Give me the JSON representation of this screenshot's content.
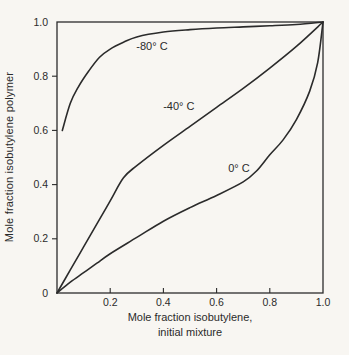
{
  "figure": {
    "background": "#f8f6f2",
    "ink": "#2b2b2b"
  },
  "chart_data": {
    "type": "line",
    "title": "",
    "xlabel": "Mole fraction isobutylene, initial mixture",
    "xlabel_lines": [
      "Mole fraction isobutylene,",
      "initial mixture"
    ],
    "ylabel": "Mole fraction isobutylene polymer",
    "xlim": [
      0,
      1.0
    ],
    "ylim": [
      0,
      1.0
    ],
    "x_tick_values": [
      0.2,
      0.4,
      0.6,
      0.8,
      1.0
    ],
    "x_tick_labels": [
      "0.2",
      "0.4",
      "0.6",
      "0.8",
      "1.0"
    ],
    "y_tick_values": [
      0,
      0.2,
      0.4,
      0.6,
      0.8,
      1.0
    ],
    "y_tick_labels": [
      "0",
      "0.2",
      "0.4",
      "0.6",
      "0.8",
      "1.0"
    ],
    "grid": false,
    "legend_position": "inline-curve-labels",
    "line_color": "#2b2b2b",
    "series": [
      {
        "name": "-80° C",
        "x": [
          0.02,
          0.05,
          0.08,
          0.12,
          0.16,
          0.2,
          0.25,
          0.3,
          0.4,
          0.5,
          0.6,
          0.7,
          0.8,
          0.9,
          1.0
        ],
        "y": [
          0.6,
          0.7,
          0.76,
          0.82,
          0.87,
          0.9,
          0.925,
          0.945,
          0.963,
          0.972,
          0.978,
          0.982,
          0.986,
          0.991,
          1.0
        ],
        "label": {
          "text": "-80° C",
          "x": 0.357,
          "y": 0.908
        }
      },
      {
        "name": "-40° C",
        "x": [
          0,
          0.05,
          0.1,
          0.15,
          0.2,
          0.25,
          0.3,
          0.4,
          0.5,
          0.6,
          0.7,
          0.8,
          0.9,
          1.0
        ],
        "y": [
          0,
          0.085,
          0.17,
          0.255,
          0.34,
          0.425,
          0.47,
          0.545,
          0.615,
          0.685,
          0.755,
          0.83,
          0.91,
          1.0
        ],
        "label": {
          "text": "-40° C",
          "x": 0.458,
          "y": 0.688
        }
      },
      {
        "name": "0° C",
        "x": [
          0,
          0.05,
          0.1,
          0.15,
          0.2,
          0.3,
          0.4,
          0.5,
          0.6,
          0.7,
          0.75,
          0.8,
          0.85,
          0.9,
          0.95,
          0.98,
          1.0
        ],
        "y": [
          0,
          0.04,
          0.075,
          0.11,
          0.145,
          0.205,
          0.265,
          0.315,
          0.36,
          0.41,
          0.45,
          0.51,
          0.565,
          0.64,
          0.745,
          0.85,
          1.0
        ],
        "label": {
          "text": "0° C",
          "x": 0.684,
          "y": 0.461
        }
      }
    ]
  }
}
